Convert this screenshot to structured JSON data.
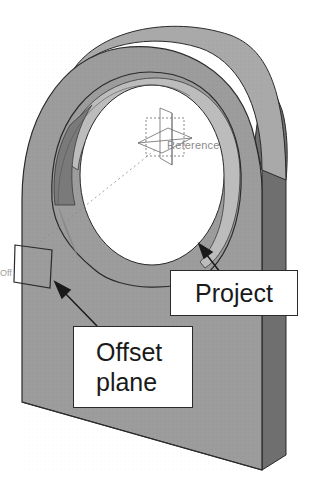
{
  "figure": {
    "labels": {
      "reference": "Reference",
      "offset_tag": "Off",
      "project_callout": "Project",
      "offset_callout_line1": "Offset",
      "offset_callout_line2": "plane"
    },
    "colors": {
      "face_front": "#9a9a9a",
      "face_side": "#6e6e6e",
      "face_top": "#b4b4b4",
      "hole_inner_dark": "#7c7c7c",
      "hole_inner_light": "#c8c8c8",
      "outline": "#2a2a2a",
      "background": "#ffffff"
    }
  }
}
